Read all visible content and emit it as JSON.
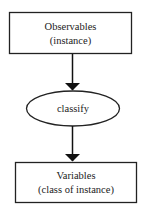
{
  "diagram": {
    "nodes": [
      {
        "id": "observables",
        "shape": "box",
        "lines": [
          "Observables",
          "(instance)"
        ]
      },
      {
        "id": "classify",
        "shape": "ellipse",
        "lines": [
          "classify"
        ]
      },
      {
        "id": "variables",
        "shape": "box",
        "lines": [
          "Variables",
          "(class of instance)"
        ]
      }
    ],
    "edges": [
      {
        "from": "observables",
        "to": "classify"
      },
      {
        "from": "classify",
        "to": "variables"
      }
    ],
    "colors": {
      "stroke": "#222222",
      "background": "#ffffff"
    }
  }
}
